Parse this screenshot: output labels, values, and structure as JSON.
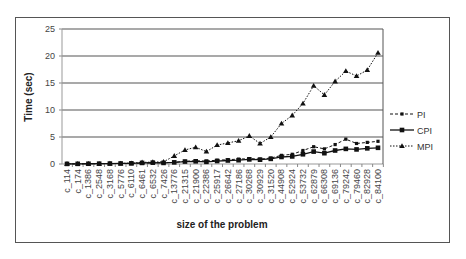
{
  "chart_data": {
    "type": "line",
    "title": "",
    "xlabel": "size of the problem",
    "ylabel": "Time (sec)",
    "ylim": [
      0,
      25
    ],
    "yticks": [
      0,
      5,
      10,
      15,
      20,
      25
    ],
    "grid": true,
    "legend_position": "right",
    "categories": [
      "c_114",
      "c_174",
      "c_1386",
      "c_2548",
      "c_3168",
      "c_5776",
      "c_6110",
      "c_6461",
      "c_6532",
      "c_7426",
      "c_13776",
      "c_21315",
      "c_21900",
      "c_22386",
      "c_25917",
      "c_26642",
      "c_27186",
      "c_30268",
      "c_30929",
      "c_31520",
      "c_44908",
      "c_52924",
      "c_53732",
      "c_62879",
      "c_66308",
      "c_69136",
      "c_79242",
      "c_79460",
      "c_82928",
      "c_84100"
    ],
    "series": [
      {
        "name": "PI",
        "style": "dashed",
        "marker": "small-square",
        "values": [
          0.02,
          0.03,
          0.05,
          0.06,
          0.08,
          0.1,
          0.12,
          0.15,
          0.2,
          0.25,
          0.3,
          0.5,
          0.6,
          0.55,
          0.7,
          0.8,
          0.9,
          1.0,
          0.9,
          1.1,
          1.6,
          1.8,
          2.5,
          3.2,
          2.8,
          3.6,
          4.6,
          3.8,
          4.0,
          4.2
        ]
      },
      {
        "name": "CPI",
        "style": "solid",
        "marker": "square",
        "values": [
          0.02,
          0.03,
          0.05,
          0.06,
          0.08,
          0.1,
          0.12,
          0.2,
          0.25,
          0.2,
          0.3,
          0.45,
          0.5,
          0.4,
          0.55,
          0.65,
          0.7,
          0.85,
          0.8,
          0.95,
          1.3,
          1.4,
          1.8,
          2.3,
          2.0,
          2.5,
          2.8,
          2.7,
          2.9,
          3.0
        ]
      },
      {
        "name": "MPI",
        "style": "dotted",
        "marker": "triangle",
        "values": [
          0.02,
          0.03,
          0.05,
          0.06,
          0.08,
          0.1,
          0.15,
          0.3,
          0.35,
          0.4,
          1.5,
          2.6,
          3.1,
          2.3,
          3.5,
          3.9,
          4.3,
          5.2,
          3.8,
          5.0,
          7.5,
          9.0,
          11.2,
          14.5,
          12.8,
          15.3,
          17.2,
          16.3,
          17.4,
          20.6
        ]
      }
    ]
  }
}
